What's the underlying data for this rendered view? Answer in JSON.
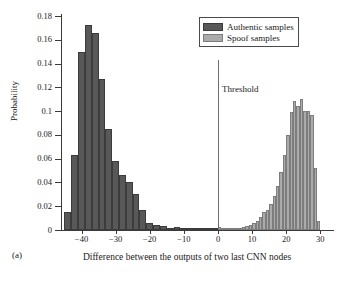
{
  "panel": {
    "label": "(a)"
  },
  "legend": {
    "items": [
      {
        "label": "Authentic samples",
        "color": "#585858",
        "key": "authentic"
      },
      {
        "label": "Spoof samples",
        "color": "#ababab",
        "key": "spoof"
      }
    ]
  },
  "annotations": [
    {
      "name": "threshold",
      "label": "Threshold",
      "x": 0
    }
  ],
  "chart_data": {
    "type": "bar",
    "title": "",
    "subtitle": "",
    "xlabel": "Difference between the outputs of two last CNN nodes",
    "ylabel": "Probability",
    "xlim": [
      -46,
      34
    ],
    "ylim": [
      0,
      0.18
    ],
    "xticks": [
      -40,
      -30,
      -20,
      -10,
      0,
      10,
      20,
      30
    ],
    "xtick_labels": [
      "−40",
      "−30",
      "−20",
      "−10",
      "0",
      "10",
      "20",
      "30"
    ],
    "yticks": [
      0,
      0.02,
      0.04,
      0.06,
      0.08,
      0.1,
      0.12,
      0.14,
      0.16,
      0.18
    ],
    "ytick_labels": [
      "0",
      "0.02",
      "0.04",
      "0.06",
      "0.08",
      "0.1",
      "0.12",
      "0.14",
      "0.16",
      "0.18"
    ],
    "grid": false,
    "legend_position": "top-right",
    "series": [
      {
        "name": "Authentic samples",
        "color": "#585858",
        "bin_width": 2,
        "x": [
          -45,
          -43,
          -41,
          -39,
          -37,
          -35,
          -33,
          -31,
          -29,
          -27,
          -25,
          -23,
          -21,
          -19,
          -17,
          -15,
          -13,
          -11,
          -9,
          -7,
          -5,
          -3,
          -1
        ],
        "values": [
          0.015,
          0.063,
          0.1495,
          0.1723,
          0.1653,
          0.1273,
          0.085,
          0.058,
          0.046,
          0.04,
          0.0305,
          0.0165,
          0.006,
          0.0038,
          0.003,
          0.0012,
          0.0025,
          0.001,
          0.0012,
          0.0018,
          0.001,
          0.0008,
          0.001
        ]
      },
      {
        "name": "Spoof samples",
        "color": "#ababab",
        "bin_width": 1,
        "x": [
          0,
          1,
          2,
          3,
          4,
          5,
          6,
          7,
          8,
          9,
          10,
          11,
          12,
          13,
          14,
          15,
          16,
          17,
          18,
          19,
          20,
          21,
          22,
          23,
          24,
          25,
          26,
          27,
          28,
          29
        ],
        "values": [
          0.0022,
          0.0006,
          0.0006,
          0.0008,
          0.001,
          0.0012,
          0.0016,
          0.0022,
          0.003,
          0.0042,
          0.006,
          0.008,
          0.011,
          0.015,
          0.017,
          0.0215,
          0.029,
          0.037,
          0.049,
          0.0635,
          0.08,
          0.099,
          0.1085,
          0.1045,
          0.1105,
          0.1005,
          0.1,
          0.0965,
          0.052,
          0.0075
        ]
      }
    ]
  }
}
